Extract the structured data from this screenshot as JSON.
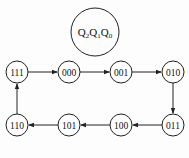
{
  "title": {
    "q2": "Q",
    "s2": "2",
    "q1": "Q",
    "s1": "1",
    "q0": "Q",
    "s0": "0"
  },
  "states": [
    {
      "label": "111",
      "x": 17,
      "y": 72
    },
    {
      "label": "000",
      "x": 69,
      "y": 72
    },
    {
      "label": "001",
      "x": 121,
      "y": 72
    },
    {
      "label": "010",
      "x": 173,
      "y": 72
    },
    {
      "label": "011",
      "x": 173,
      "y": 125
    },
    {
      "label": "100",
      "x": 121,
      "y": 125
    },
    {
      "label": "101",
      "x": 69,
      "y": 125
    },
    {
      "label": "110",
      "x": 17,
      "y": 125
    }
  ],
  "colors": {
    "stroke": "#222222",
    "text": "#111111"
  }
}
